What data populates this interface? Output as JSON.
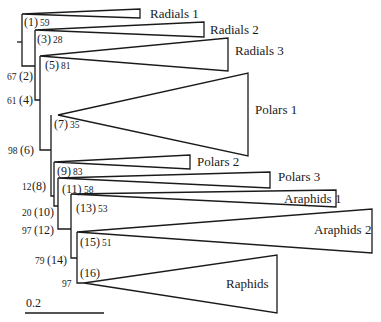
{
  "diagram": {
    "type": "phylogenetic-tree",
    "scale_bar": {
      "label": "0.2",
      "value": 0.2
    },
    "clades": [
      {
        "name": "Radials 1"
      },
      {
        "name": "Radials 2"
      },
      {
        "name": "Radials 3"
      },
      {
        "name": "Polars 1"
      },
      {
        "name": "Polars 2"
      },
      {
        "name": "Polars 3"
      },
      {
        "name": "Araphids 1"
      },
      {
        "name": "Araphids 2"
      },
      {
        "name": "Raphids"
      }
    ],
    "nodes": [
      {
        "id": "(1)",
        "support": "59"
      },
      {
        "id": "(2)",
        "support": "67"
      },
      {
        "id": "(3)",
        "support": "28"
      },
      {
        "id": "(4)",
        "support": "61"
      },
      {
        "id": "(5)",
        "support": "81"
      },
      {
        "id": "(6)",
        "support": "98"
      },
      {
        "id": "(7)",
        "support": "35"
      },
      {
        "id": "(8)",
        "support": "12"
      },
      {
        "id": "(9)",
        "support": "83"
      },
      {
        "id": "(10)",
        "support": "20"
      },
      {
        "id": "(11)",
        "support": "58"
      },
      {
        "id": "(12)",
        "support": "97"
      },
      {
        "id": "(13)",
        "support": "53"
      },
      {
        "id": "(14)",
        "support": "79"
      },
      {
        "id": "(15)",
        "support": "51"
      },
      {
        "id": "(16)",
        "support": "97"
      }
    ]
  }
}
